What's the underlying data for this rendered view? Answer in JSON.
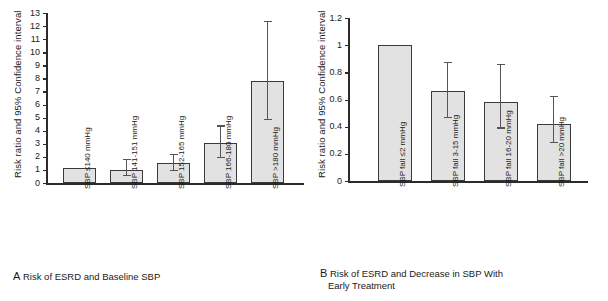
{
  "figure": {
    "panels": [
      {
        "id": "A",
        "letter": "A",
        "caption": "Risk of ESRD and Baseline SBP",
        "caption_lines": [
          "Risk of ESRD and Baseline SBP"
        ],
        "ylabel": "Risk ratio and 95% Confidence interval"
      },
      {
        "id": "B",
        "letter": "B",
        "caption": "Risk of ESRD and Decrease in SBP With Early Treatment",
        "caption_lines": [
          "Risk of ESRD and Decrease in SBP With",
          "Early Treatment"
        ],
        "ylabel": "Risk ratio and 95% Confidence interval"
      }
    ]
  },
  "chart_data": [
    {
      "type": "bar",
      "panel": "A",
      "title": "A Risk of ESRD and Baseline SBP",
      "xlabel": "",
      "ylabel": "Risk ratio and 95% Confidence interval",
      "ylim": [
        0,
        13
      ],
      "yticks": [
        0,
        1,
        2,
        3,
        4,
        5,
        6,
        7,
        8,
        9,
        10,
        11,
        12,
        13
      ],
      "ytick_labels": [
        "0",
        "1",
        "2",
        "3",
        "4",
        "5",
        "6",
        "7",
        "8",
        "9",
        "10",
        "11",
        "12",
        "13"
      ],
      "grid": false,
      "legend": null,
      "categories": [
        "SBP ≤140 mmHg",
        "SBP 141-151 mmHg",
        "SBP 152-165 mmHg",
        "SBP 166-180 mmHg",
        "SBP >180 mmHg"
      ],
      "values": [
        1.15,
        1.0,
        1.55,
        3.05,
        7.8
      ],
      "error_low": [
        null,
        0.62,
        1.0,
        2.0,
        4.9
      ],
      "error_high": [
        null,
        1.85,
        2.2,
        4.4,
        12.4
      ]
    },
    {
      "type": "bar",
      "panel": "B",
      "title": "B Risk of ESRD and Decrease in SBP With Early Treatment",
      "xlabel": "",
      "ylabel": "Risk ratio and 95% Confidence interval",
      "ylim": [
        0,
        1.2
      ],
      "yticks": [
        0,
        0.2,
        0.4,
        0.6,
        0.8,
        1,
        1.2
      ],
      "ytick_labels": [
        "0",
        "0.2",
        "0.4",
        "0.6",
        "0.8",
        "1",
        "1.2"
      ],
      "grid": false,
      "legend": null,
      "categories": [
        "SBP fall ≤2 mmHg",
        "SBP fall 3-15 mmHg",
        "SBP fall 16-20 mmHg",
        "SBP fall >20 mmHg"
      ],
      "values": [
        1.0,
        0.665,
        0.585,
        0.42
      ],
      "error_low": [
        null,
        0.47,
        0.395,
        0.29
      ],
      "error_high": [
        null,
        0.875,
        0.865,
        0.625
      ]
    }
  ],
  "colors": {
    "bar_fill": "#e2e2e2",
    "bar_stroke": "#3a3a3a",
    "axis": "#2b2b2b",
    "error": "#555555",
    "text": "#1a1a1a",
    "background": "#ffffff"
  }
}
